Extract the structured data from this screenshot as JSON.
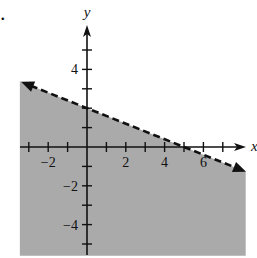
{
  "figure": {
    "marker": "."
  },
  "chart_data": {
    "type": "inequality_graph",
    "title": "",
    "xlabel": "x",
    "ylabel": "y",
    "xlim": [
      -3.5,
      8
    ],
    "ylim": [
      -5.5,
      6
    ],
    "x_ticks": [
      -3,
      -2,
      -1,
      1,
      2,
      3,
      4,
      5,
      6,
      7
    ],
    "y_ticks": [
      -5,
      -4,
      -3,
      -2,
      -1,
      1,
      2,
      3,
      4,
      5
    ],
    "x_tick_labels": [
      {
        "value": -2,
        "label": "−2"
      },
      {
        "value": 2,
        "label": "2"
      },
      {
        "value": 4,
        "label": "4"
      },
      {
        "value": 6,
        "label": "6"
      }
    ],
    "y_tick_labels": [
      {
        "value": 4,
        "label": "4"
      },
      {
        "value": -2,
        "label": "−2"
      },
      {
        "value": -4,
        "label": "−4"
      }
    ],
    "boundary_line": {
      "equation": "2x + 5y = 10",
      "slope": -0.4,
      "y_intercept": 2,
      "x_intercept": 5,
      "style": "dashed",
      "arrows": "both"
    },
    "shaded_region": "below line",
    "inequality": "2x + 5y < 10",
    "colors": {
      "shade": "#aaaaaa",
      "axes": "#111111",
      "line": "#111111"
    }
  }
}
